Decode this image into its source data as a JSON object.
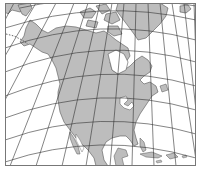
{
  "map": {
    "subject": "North America",
    "projection": "conic",
    "colors": {
      "land": "#bdbdbd",
      "water": "#ffffff",
      "coastline": "#555555",
      "graticule": "#333333",
      "frame": "#777777"
    },
    "frame": {
      "x": 5,
      "y": 3,
      "width": 191,
      "height": 163
    },
    "graticule": {
      "meridians_visible": 14,
      "parallels_visible": 8
    }
  }
}
